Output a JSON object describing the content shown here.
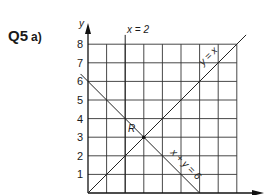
{
  "question": {
    "number": "Q5",
    "part": "a)"
  },
  "chart_data": {
    "type": "line",
    "title": "",
    "xlabel": "x",
    "ylabel": "y",
    "xlim": [
      0,
      8
    ],
    "ylim": [
      0,
      8
    ],
    "grid": true,
    "y_ticks": [
      "1",
      "2",
      "3",
      "4",
      "5",
      "6",
      "7",
      "8"
    ],
    "lines": [
      {
        "name": "x = 2",
        "equation": "x = 2",
        "points": [
          [
            2,
            0
          ],
          [
            2,
            8.5
          ]
        ]
      },
      {
        "name": "y = x",
        "equation": "y = x",
        "points": [
          [
            0,
            0
          ],
          [
            8.5,
            8.5
          ]
        ]
      },
      {
        "name": "x + y = 6",
        "equation": "x + y = 6",
        "points": [
          [
            -0.4,
            6.4
          ],
          [
            6,
            0
          ]
        ]
      }
    ],
    "annotations": [
      {
        "text": "R",
        "x": 1.6,
        "y": 3.3
      },
      {
        "text": "intersection point",
        "x": 3,
        "y": 3
      }
    ]
  },
  "labels": {
    "y_axis": "y",
    "x_eq_2": "x = 2",
    "y_eq_x": "y = x",
    "x_plus_y": "x + y = 6",
    "region": "R"
  }
}
